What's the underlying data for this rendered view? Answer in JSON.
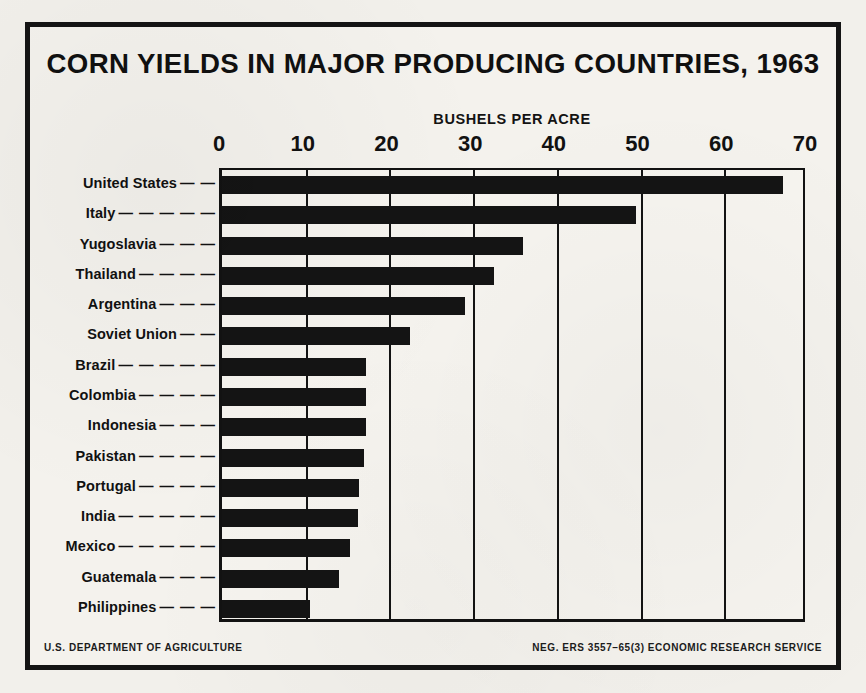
{
  "poster": {
    "title": "CORN YIELDS IN MAJOR PRODUCING COUNTRIES, 1963",
    "background_color": "#f2f0eb",
    "ink_color": "#141414"
  },
  "footer": {
    "left": "U.S. DEPARTMENT OF AGRICULTURE",
    "right": "NEG. ERS 3557–65(3) ECONOMIC RESEARCH SERVICE"
  },
  "chart_data": {
    "type": "bar",
    "orientation": "horizontal",
    "title": "CORN YIELDS IN MAJOR PRODUCING COUNTRIES, 1963",
    "xlabel": "BUSHELS PER ACRE",
    "ylabel": "",
    "xlim": [
      0,
      70
    ],
    "xticks": [
      0,
      10,
      20,
      30,
      40,
      50,
      60,
      70
    ],
    "xticklabels": [
      "0",
      "10",
      "20",
      "30",
      "40",
      "50",
      "60",
      "70"
    ],
    "grid": "vertical",
    "legend": "none",
    "bar_color": "#141414",
    "categories": [
      "United States",
      "Italy",
      "Yugoslavia",
      "Thailand",
      "Argentina",
      "Soviet Union",
      "Brazil",
      "Colombia",
      "Indonesia",
      "Pakistan",
      "Portugal",
      "India",
      "Mexico",
      "Guatemala",
      "Philippines"
    ],
    "values": [
      67,
      49.5,
      36,
      32.5,
      29,
      22.5,
      17.2,
      17.2,
      17.2,
      17,
      16.4,
      16.3,
      15.3,
      14,
      10.5
    ],
    "labels_with_leaders": [
      "United States — —",
      "Italy — — — — —",
      "Yugoslavia — — —",
      "Thailand — — — —",
      "Argentina — — —",
      "Soviet Union — —",
      "Brazil — — — — —",
      "Colombia — — — —",
      "Indonesia — — —",
      "Pakistan — — — —",
      "Portugal — — — —",
      "India — — — — —",
      "Mexico — — — — —",
      "Guatemala — — —",
      "Philippines — — —"
    ],
    "leaders": [
      "— —",
      "— — — — —",
      "— — —",
      "— — — —",
      "— — —",
      "— —",
      "— — — — —",
      "— — — —",
      "— — —",
      "— — — —",
      "— — — —",
      "— — — — —",
      "— — — — —",
      "— — —",
      "— — —"
    ]
  }
}
